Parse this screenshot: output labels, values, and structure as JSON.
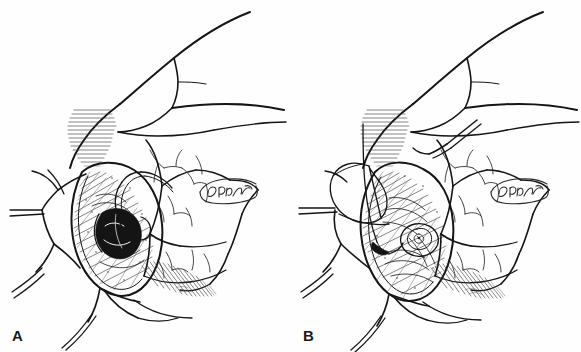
{
  "figure": {
    "medium": "pen-and-ink line drawing",
    "background_color": "#fefefe",
    "ink_color": "#151515",
    "width": 581,
    "height": 352
  },
  "panels": [
    {
      "id": "a",
      "label": "A",
      "caption_text": "",
      "signature": "P. Brayton",
      "stage": "exposed lumen with hook retractor",
      "elements": [
        "curved tubular structure across upper field",
        "oval operative field with stippled tissue surface",
        "dark circular lumen opening at center",
        "hook retractor engaging lumen edge",
        "radiating retractor tines and drape edges at left",
        "branching vessel markings on right tissue flaps",
        "horizontal hatched shadow at upper left of field",
        "diagonal hatched shadow at lower right"
      ]
    },
    {
      "id": "b",
      "label": "B",
      "caption_text": "",
      "signature": "P. Brayton",
      "stage": "closure with suture loop and needle",
      "elements": [
        "curved tubular structure across upper field",
        "oval operative field with stippled tissue surface",
        "large suture loop over left margin of field",
        "coiled suture knot at center of field",
        "needle passing through upper tissue margin",
        "radiating retractor tines and drape edges at left",
        "branching vessel markings on right tissue flaps",
        "horizontal hatched shadow at upper left of field",
        "diagonal hatched shadow at lower right"
      ]
    }
  ]
}
